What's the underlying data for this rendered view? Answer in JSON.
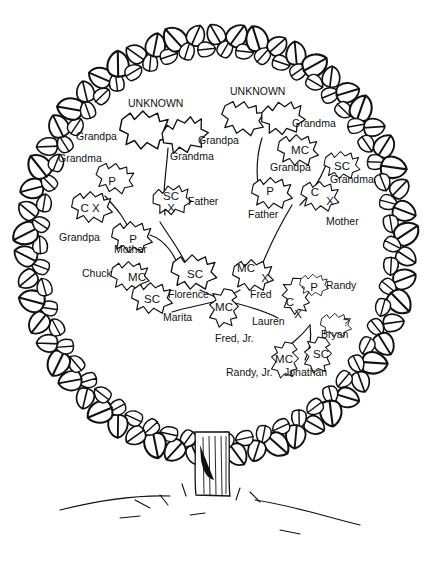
{
  "colors": {
    "ink": "#111111",
    "paper": "#ffffff"
  },
  "nodes": [
    {
      "id": "unknown-left-pair",
      "label": "UNKNOWN",
      "x": 158,
      "y": 110,
      "code": ""
    },
    {
      "id": "grandpa-pgp",
      "label": "Grandpa",
      "x": 78,
      "y": 140,
      "code": ""
    },
    {
      "id": "grandpa-pgp2",
      "label": "Grandpa",
      "x": 198,
      "y": 144,
      "code": ""
    },
    {
      "id": "grandma-pgm",
      "label": "Grandma",
      "x": 170,
      "y": 160,
      "code": ""
    },
    {
      "id": "grandma-left",
      "label": "Grandma",
      "x": 58,
      "y": 162,
      "code": ""
    },
    {
      "id": "p-left",
      "label": "",
      "x": 112,
      "y": 180,
      "code": "P"
    },
    {
      "id": "grandpa-cx",
      "label": "Grandpa",
      "x": 60,
      "y": 237,
      "code": "C X"
    },
    {
      "id": "mother-left",
      "label": "Mother",
      "x": 115,
      "y": 250,
      "code": "P"
    },
    {
      "id": "father-left",
      "label": "Father",
      "x": 188,
      "y": 202,
      "code": "SC\nX"
    },
    {
      "id": "florence",
      "label": "Florence",
      "x": 168,
      "y": 294,
      "code": "SC"
    },
    {
      "id": "unknown-right-pair",
      "label": "UNKNOWN",
      "x": 253,
      "y": 95,
      "code": ""
    },
    {
      "id": "grandma-right1",
      "label": "Grandma",
      "x": 293,
      "y": 125,
      "code": ""
    },
    {
      "id": "mc-right",
      "label": "Grandpa",
      "x": 270,
      "y": 167,
      "code": "MC"
    },
    {
      "id": "sc-right",
      "label": "Grandma",
      "x": 330,
      "y": 180,
      "code": "SC"
    },
    {
      "id": "father-right",
      "label": "Father",
      "x": 248,
      "y": 216,
      "code": "P"
    },
    {
      "id": "mother-right",
      "label": "Mother",
      "x": 325,
      "y": 222,
      "code": "C X"
    },
    {
      "id": "fred",
      "label": "Fred",
      "x": 262,
      "y": 296,
      "code": "MC X"
    },
    {
      "id": "chuck",
      "label": "Chuck",
      "x": 82,
      "y": 274,
      "code": "MC"
    },
    {
      "id": "marita",
      "label": "Marita",
      "x": 163,
      "y": 318,
      "code": "SC"
    },
    {
      "id": "fred-jr",
      "label": "Fred, Jr.",
      "x": 215,
      "y": 339,
      "code": "MC"
    },
    {
      "id": "randy",
      "label": "Randy",
      "x": 326,
      "y": 286,
      "code": "P"
    },
    {
      "id": "lauren",
      "label": "Lauren",
      "x": 252,
      "y": 322,
      "code": "C X"
    },
    {
      "id": "bryan",
      "label": "Bryan",
      "x": 322,
      "y": 335,
      "code": "?"
    },
    {
      "id": "randy-jr",
      "label": "Randy, Jr.",
      "x": 226,
      "y": 373,
      "code": "MC"
    },
    {
      "id": "jonathan",
      "label": "Jonathan",
      "x": 284,
      "y": 373,
      "code": "SC"
    }
  ],
  "labels": {
    "unknown_left": "UNKNOWN",
    "unknown_right": "UNKNOWN",
    "grandpa_1": "Grandpa",
    "grandma_1": "Grandma",
    "grandpa_2": "Grandpa",
    "grandma_2": "Grandma",
    "grandpa_3": "Grandpa",
    "mother_1": "Mother",
    "father_1": "Father",
    "florence": "Florence",
    "grandma_3": "Grandma",
    "grandpa_4": "Grandpa",
    "grandma_4": "Grandma",
    "father_2": "Father",
    "mother_2": "Mother",
    "fred": "Fred",
    "chuck": "Chuck",
    "marita": "Marita",
    "fred_jr": "Fred, Jr.",
    "randy": "Randy",
    "lauren": "Lauren",
    "bryan": "Bryan",
    "randy_jr": "Randy, Jr.",
    "jonathan": "Jonathan"
  },
  "codes": {
    "p_gm_left": "P",
    "cx_gp_left": "C X",
    "p_mother_left": "P",
    "sc_father_left_1": "SC",
    "sc_father_left_2": "X",
    "sc_florence": "SC",
    "mc_gp_right": "MC",
    "sc_gm_right": "SC",
    "p_father_right": "P",
    "c_mother_right": "C",
    "x_mother_right": "X",
    "mc_fred": "MC",
    "x_fred": "X",
    "mc_chuck": "MC",
    "sc_marita": "SC",
    "mc_fred_jr": "MC",
    "p_randy": "P",
    "c_lauren": "C",
    "x_lauren": "X",
    "q_bryan": "?",
    "mc_randy_jr": "MC",
    "sc_jonathan": "SC"
  },
  "legend_codes": [
    "P",
    "C",
    "X",
    "SC",
    "MC",
    "?"
  ]
}
